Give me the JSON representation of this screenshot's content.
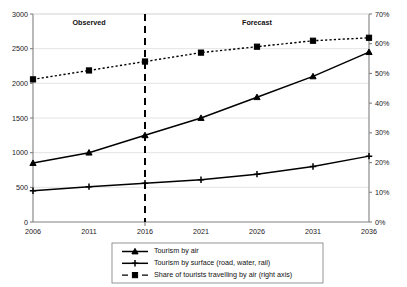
{
  "chart_data": {
    "type": "line",
    "title": "",
    "xlabel": "",
    "ylabel": "",
    "y2label": "",
    "grid": true,
    "legend_position": "bottom",
    "categories": [
      2006,
      2011,
      2016,
      2021,
      2026,
      2031,
      2036
    ],
    "x_tick_labels": [
      "2006",
      "2011",
      "2016",
      "2021",
      "2026",
      "2031",
      "2036"
    ],
    "xlim": [
      2006,
      2036
    ],
    "ylim": [
      0,
      3000
    ],
    "y_tick_labels": [
      "0",
      "500",
      "1000",
      "1500",
      "2000",
      "2500",
      "3000"
    ],
    "y_ticks": [
      0,
      500,
      1000,
      1500,
      2000,
      2500,
      3000
    ],
    "y2lim": [
      0,
      70
    ],
    "y2_tick_labels": [
      "0%",
      "10%",
      "20%",
      "30%",
      "40%",
      "50%",
      "60%",
      "70%"
    ],
    "y2_ticks": [
      0,
      10,
      20,
      30,
      40,
      50,
      60,
      70
    ],
    "annotations": [
      {
        "text": "Observed",
        "x": 2011,
        "axis": "top"
      },
      {
        "text": "Forecast",
        "x": 2026,
        "axis": "top"
      },
      {
        "text": "divider",
        "x": 2016,
        "style": "dashed-vertical"
      }
    ],
    "series": [
      {
        "name": "Tourism by air",
        "axis": "left",
        "style": "solid",
        "marker": "triangle",
        "values": [
          850,
          1000,
          1250,
          1500,
          1800,
          2100,
          2450
        ]
      },
      {
        "name": "Tourism by surface (road, water, rail)",
        "axis": "left",
        "style": "solid",
        "marker": "plus",
        "values": [
          450,
          510,
          560,
          610,
          690,
          800,
          950
        ]
      },
      {
        "name": "Share of tourists travelling by air (right axis)",
        "axis": "right",
        "style": "dotted",
        "marker": "square",
        "values": [
          48,
          51,
          54,
          57,
          59,
          61,
          62
        ]
      }
    ]
  },
  "legend": {
    "items": [
      {
        "label": "Tourism by air",
        "marker": "triangle",
        "style": "solid"
      },
      {
        "label": "Tourism by surface (road, water, rail)",
        "marker": "plus",
        "style": "solid"
      },
      {
        "label": "Share of tourists travelling by air (right axis)",
        "marker": "square",
        "style": "dotted"
      }
    ]
  },
  "colors": {
    "series": "#000000",
    "grid": "#d9d9d9",
    "axis": "#808080",
    "background": "#ffffff"
  }
}
